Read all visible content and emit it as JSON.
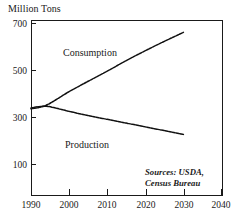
{
  "chart_data": {
    "type": "line",
    "title": "",
    "ylabel": "Million Tons",
    "xlabel": "",
    "xlim": [
      1990,
      2040
    ],
    "ylim": [
      0,
      700
    ],
    "grid": false,
    "legend_position": "inline-annotation",
    "yticks": [
      100,
      300,
      500,
      700
    ],
    "xticks": [
      1990,
      2000,
      2010,
      2020,
      2030,
      2040
    ],
    "x": [
      1990,
      1992,
      1994,
      1996,
      1998,
      2000,
      2005,
      2010,
      2015,
      2020,
      2025,
      2030
    ],
    "series": [
      {
        "name": "Consumption",
        "values": [
          335,
          340,
          350,
          368,
          388,
          408,
          452,
          495,
          540,
          582,
          622,
          660
        ]
      },
      {
        "name": "Production",
        "values": [
          338,
          344,
          346,
          340,
          332,
          324,
          306,
          290,
          274,
          258,
          242,
          226
        ]
      }
    ],
    "annotations": {
      "consumption_label": "Consumption",
      "production_label": "Production",
      "source_line1": "Sources: USDA,",
      "source_line2": "Census Bureau"
    }
  },
  "axis": {
    "y_title": "Million Tons",
    "y_tick_labels": [
      "700",
      "500",
      "300",
      "100"
    ],
    "x_tick_labels": [
      "1990",
      "2000",
      "2010",
      "2020",
      "2030",
      "2040"
    ]
  }
}
